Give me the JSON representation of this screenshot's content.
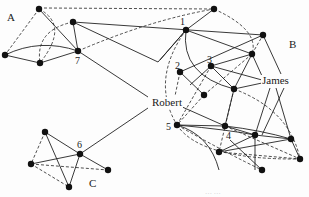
{
  "diagram": {
    "type": "network",
    "colors": {
      "node": "#111111",
      "edge": "#222222",
      "background": "#fdfdfd"
    },
    "regions": [
      {
        "id": "A",
        "label": "A",
        "x": 7,
        "y": 12
      },
      {
        "id": "B",
        "label": "B",
        "x": 289,
        "y": 39
      },
      {
        "id": "C",
        "label": "C",
        "x": 89,
        "y": 178
      }
    ],
    "people": [
      {
        "id": "james",
        "label": "James",
        "x": 263,
        "y": 75
      },
      {
        "id": "robert",
        "label": "Robert",
        "x": 151,
        "y": 97
      }
    ],
    "node_numbers": [
      {
        "label": "1",
        "x": 180,
        "y": 17
      },
      {
        "label": "2",
        "x": 175,
        "y": 61
      },
      {
        "label": "3",
        "x": 207,
        "y": 55
      },
      {
        "label": "4",
        "x": 226,
        "y": 131
      },
      {
        "label": "5",
        "x": 166,
        "y": 122
      },
      {
        "label": "6",
        "x": 77,
        "y": 140
      },
      {
        "label": "7",
        "x": 75,
        "y": 56
      }
    ],
    "nodes": [
      {
        "id": "a1",
        "x": 39,
        "y": 9
      },
      {
        "id": "a2",
        "x": 73,
        "y": 22
      },
      {
        "id": "n7",
        "x": 78,
        "y": 51
      },
      {
        "id": "a3",
        "x": 5,
        "y": 55
      },
      {
        "id": "a4",
        "x": 40,
        "y": 63
      },
      {
        "id": "t",
        "x": 214,
        "y": 9
      },
      {
        "id": "n1",
        "x": 186,
        "y": 30
      },
      {
        "id": "br",
        "x": 263,
        "y": 35
      },
      {
        "id": "bm",
        "x": 252,
        "y": 54
      },
      {
        "id": "n2",
        "x": 180,
        "y": 72
      },
      {
        "id": "n3",
        "x": 211,
        "y": 66
      },
      {
        "id": "bc",
        "x": 204,
        "y": 95
      },
      {
        "id": "bj",
        "x": 234,
        "y": 89
      },
      {
        "id": "n5",
        "x": 177,
        "y": 125
      },
      {
        "id": "n4",
        "x": 225,
        "y": 126
      },
      {
        "id": "b6",
        "x": 255,
        "y": 135
      },
      {
        "id": "b7",
        "x": 291,
        "y": 139
      },
      {
        "id": "b8",
        "x": 219,
        "y": 152
      },
      {
        "id": "b9",
        "x": 300,
        "y": 159
      },
      {
        "id": "b10",
        "x": 262,
        "y": 170
      },
      {
        "id": "c1",
        "x": 45,
        "y": 132
      },
      {
        "id": "n6",
        "x": 80,
        "y": 154
      },
      {
        "id": "c3",
        "x": 31,
        "y": 164
      },
      {
        "id": "c4",
        "x": 108,
        "y": 170
      },
      {
        "id": "c5",
        "x": 69,
        "y": 187
      }
    ],
    "solid_edges": [
      [
        "a1",
        "n7"
      ],
      [
        "a3",
        "a4"
      ],
      [
        "a4",
        "n7"
      ],
      [
        "a2",
        "n7"
      ],
      [
        "a2",
        "br"
      ],
      [
        "a2",
        "bm"
      ],
      [
        "n7",
        "robert_l"
      ],
      [
        "n1",
        "t"
      ],
      [
        "n1",
        "br"
      ],
      [
        "n1",
        "bm"
      ],
      [
        "n1",
        "n2"
      ],
      [
        "n3",
        "bm"
      ],
      [
        "n3",
        "james_l"
      ],
      [
        "n3",
        "bj"
      ],
      [
        "bj",
        "bm"
      ],
      [
        "bj",
        "james_l"
      ],
      [
        "bc",
        "n2"
      ],
      [
        "n2",
        "br"
      ],
      [
        "br",
        "james_l"
      ],
      [
        "bm",
        "james_l"
      ],
      [
        "robert_r",
        "n4"
      ],
      [
        "robert_r",
        "bc"
      ],
      [
        "n5",
        "n4"
      ],
      [
        "n5",
        "b6"
      ],
      [
        "n4",
        "b6"
      ],
      [
        "n4",
        "b7"
      ],
      [
        "b6",
        "b7"
      ],
      [
        "b6",
        "b8"
      ],
      [
        "b8",
        "b7"
      ],
      [
        "b6",
        "b10"
      ],
      [
        "b7",
        "b9"
      ],
      [
        "bj",
        "n4"
      ],
      [
        "james_l",
        "b6"
      ],
      [
        "james_l",
        "b7"
      ],
      [
        "james_l",
        "b9"
      ],
      [
        "n6",
        "robert_l2"
      ],
      [
        "c1",
        "n6"
      ],
      [
        "c1",
        "c5"
      ],
      [
        "c3",
        "n6"
      ],
      [
        "n6",
        "c5"
      ],
      [
        "n6",
        "c4"
      ]
    ],
    "dashed_edges": [
      [
        "a1",
        "a3"
      ],
      [
        "a1",
        "t"
      ],
      [
        "n7",
        "t"
      ],
      [
        "bm",
        "br"
      ],
      [
        "n3",
        "n5"
      ],
      [
        "n2",
        "robert_t"
      ],
      [
        "bc",
        "n5"
      ],
      [
        "bj",
        "b8"
      ],
      [
        "bm",
        "b8"
      ],
      [
        "n5",
        "b9"
      ],
      [
        "n5",
        "b10"
      ],
      [
        "b8",
        "b9"
      ],
      [
        "c1",
        "c3"
      ],
      [
        "c3",
        "c5"
      ],
      [
        "c3",
        "c4"
      ]
    ],
    "caption": "… …"
  }
}
